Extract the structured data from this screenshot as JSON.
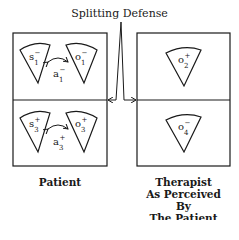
{
  "title": "Splitting Defense",
  "captions": {
    "left": "Patient",
    "right_lines": [
      "Therapist",
      "As Perceived By",
      "The Patient"
    ]
  },
  "boxes": {
    "patient": {
      "top": {
        "self": {
          "base": "s",
          "sub": "1",
          "sup": "−"
        },
        "object": {
          "base": "o",
          "sub": "1",
          "sup": "−"
        },
        "affect": {
          "base": "a",
          "sub": "1",
          "sup": "−"
        }
      },
      "bottom": {
        "self": {
          "base": "s",
          "sub": "3",
          "sup": "+"
        },
        "object": {
          "base": "o",
          "sub": "3",
          "sup": "+"
        },
        "affect": {
          "base": "a",
          "sub": "3",
          "sup": "+"
        }
      }
    },
    "therapist": {
      "top": {
        "object": {
          "base": "o",
          "sub": "2",
          "sup": "+"
        }
      },
      "bottom": {
        "object": {
          "base": "o",
          "sub": "4",
          "sup": "−"
        }
      }
    }
  },
  "colors": {
    "line": "#1a1a1a",
    "background": "#ffffff"
  }
}
